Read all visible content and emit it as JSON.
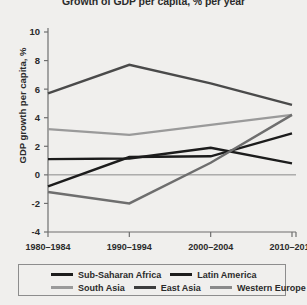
{
  "chart_data": {
    "type": "line",
    "title": "Growth of GDP per capita, % per year",
    "xlabel": "",
    "ylabel": "GDP growth per capita, %",
    "categories": [
      "1980–1984",
      "1990–1994",
      "2000–2004",
      "2010–2012"
    ],
    "ylim": [
      -4,
      10
    ],
    "yticks": [
      -4,
      -2,
      0,
      2,
      4,
      6,
      8,
      10
    ],
    "ytick_labels": [
      "-4",
      "-2",
      "0",
      "2",
      "4",
      "6",
      "8",
      "10"
    ],
    "grid": false,
    "zero_line": true,
    "legend_position": "bottom",
    "series": [
      {
        "name": "Sub-Saharan Africa",
        "color": "#1c1c1c",
        "values": [
          -0.8,
          1.25,
          1.3,
          2.9
        ]
      },
      {
        "name": "Latin America",
        "color": "#1c1c1c",
        "values": [
          1.1,
          1.15,
          1.9,
          0.8
        ]
      },
      {
        "name": "South Asia",
        "color": "#9a9a9a",
        "values": [
          3.2,
          2.8,
          3.5,
          4.2
        ]
      },
      {
        "name": "East Asia",
        "color": "#6e6e6e",
        "values": [
          -1.2,
          -2.0,
          0.85,
          4.2
        ]
      },
      {
        "name": "Western Europe",
        "color": "#4a4a4a",
        "values": [
          5.7,
          7.7,
          6.4,
          4.9
        ]
      }
    ]
  },
  "legend": {
    "rows": [
      [
        {
          "label": "Sub-Saharan Africa",
          "color": "#1c1c1c"
        },
        {
          "label": "Latin America",
          "color": "#1c1c1c"
        }
      ],
      [
        {
          "label": "South Asia",
          "color": "#9a9a9a"
        },
        {
          "label": "East Asia",
          "color": "#3d3d3d"
        },
        {
          "label": "Western Europe",
          "color": "#8a8a8a"
        }
      ]
    ]
  }
}
